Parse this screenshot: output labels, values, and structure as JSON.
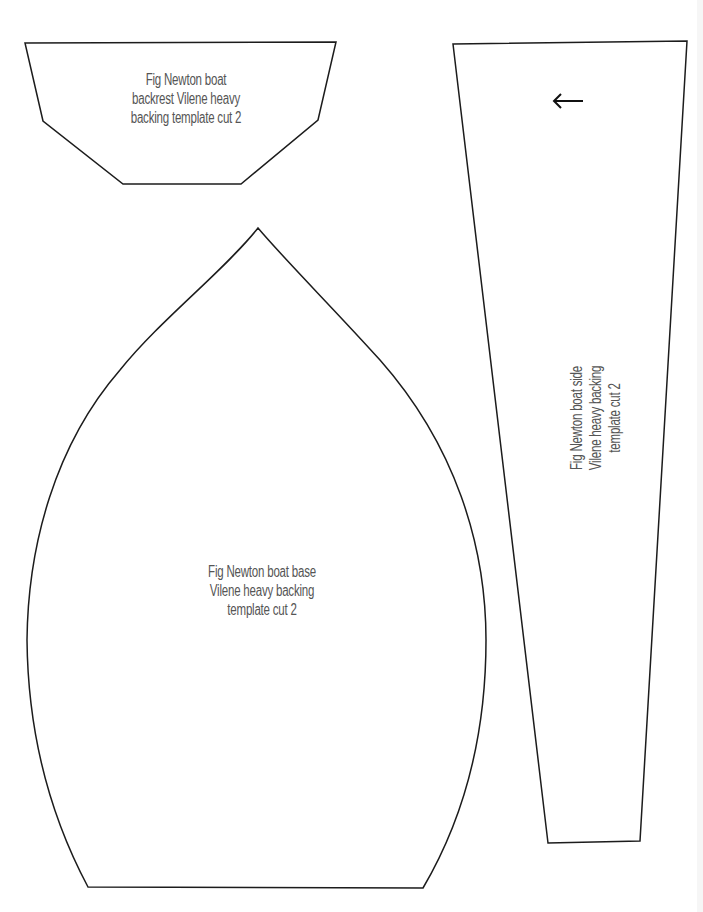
{
  "document": {
    "type": "sewing pattern template sheet",
    "background_color": "#ffffff",
    "outline_color": "#1c1c1c",
    "text_color": "#555555"
  },
  "pieces": {
    "backrest": {
      "name": "backrest",
      "lines": [
        "Fig Newton boat",
        "backrest Vilene heavy",
        "backing template cut 2"
      ]
    },
    "side": {
      "name": "side",
      "arrow_icon": "left-arrow-icon",
      "arrow_glyph": "←",
      "lines": [
        "Fig Newton boat side",
        "Vilene heavy backing",
        "template cut 2"
      ]
    },
    "base": {
      "name": "base",
      "lines": [
        "Fig Newton boat base",
        "Vilene heavy backing",
        "template cut 2"
      ]
    }
  }
}
